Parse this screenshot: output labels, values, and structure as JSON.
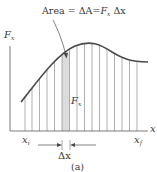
{
  "figure": {
    "title_annotation": {
      "prefix": "Area",
      "eq1": "=",
      "delta_a": "ΔA",
      "eq2": "=",
      "force": "F",
      "force_sub": "x",
      "dx": "Δx"
    },
    "y_axis_label": {
      "main": "F",
      "sub": "x"
    },
    "x_axis_label": "x",
    "strip_height_label": {
      "main": "F",
      "sub": "x"
    },
    "x_start_label": {
      "main": "x",
      "sub": "i"
    },
    "x_end_label": {
      "main": "x",
      "sub": "f"
    },
    "width_label": "Δx",
    "caption": "(a)",
    "colors": {
      "curve": "#4a4a4a",
      "lines": "#8a8a8a",
      "axes": "#5a5a5a",
      "strip_fill": "#d9d9d9",
      "text": "#3a3a3a"
    }
  }
}
